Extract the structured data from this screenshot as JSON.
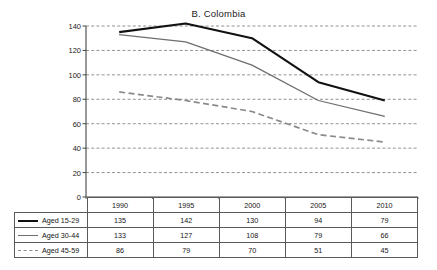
{
  "chart_data": {
    "type": "line",
    "title": "B. Colombia",
    "xlabel": "",
    "ylabel": "",
    "categories": [
      "1990",
      "1995",
      "2000",
      "2005",
      "2010"
    ],
    "ylim": [
      0,
      140
    ],
    "yticks": [
      "0",
      "20",
      "40",
      "60",
      "80",
      "100",
      "120",
      "140"
    ],
    "grid": "horizontal-dashed",
    "legend_position": "table-left-column",
    "series": [
      {
        "name": "Aged 15-29",
        "values": [
          135,
          142,
          130,
          94,
          79
        ],
        "style": "solid-thick",
        "color": "#111111"
      },
      {
        "name": "Aged 30-44",
        "values": [
          133,
          127,
          108,
          79,
          66
        ],
        "style": "solid-thin",
        "color": "#6e6e6e"
      },
      {
        "name": "Aged 45-59",
        "values": [
          86,
          79,
          70,
          51,
          45
        ],
        "style": "dashed",
        "color": "#8a8a8a"
      }
    ]
  },
  "table": {
    "corner_label": "",
    "column_headers": [
      "1990",
      "1995",
      "2000",
      "2005",
      "2010"
    ],
    "rows": [
      {
        "label": "Aged 15-29",
        "values": [
          "135",
          "142",
          "130",
          "94",
          "79"
        ]
      },
      {
        "label": "Aged 30-44",
        "values": [
          "133",
          "127",
          "108",
          "79",
          "66"
        ]
      },
      {
        "label": "Aged 45-59",
        "values": [
          "86",
          "79",
          "70",
          "51",
          "45"
        ]
      }
    ]
  },
  "colors": {
    "series_1": "#111111",
    "series_2": "#6e6e6e",
    "series_3": "#8a8a8a",
    "grid": "#777777",
    "axis": "#444444",
    "table_border": "#5a5a5a"
  }
}
